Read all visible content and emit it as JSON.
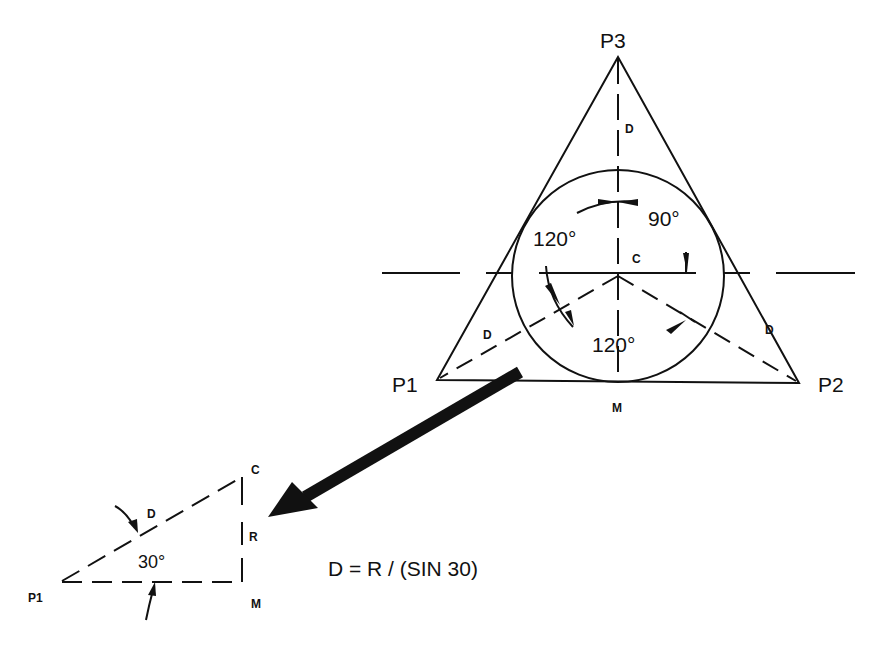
{
  "diagram": {
    "type": "geometric construction",
    "main_figure": {
      "shape": "equilateral triangle with inscribed circle",
      "vertices": {
        "p1": "P1",
        "p2": "P2",
        "p3": "P3"
      },
      "center_label": "C",
      "midpoint_label": "M",
      "distance_labels": [
        "D",
        "D",
        "D"
      ],
      "angles": {
        "left": "120°",
        "bottom": "120°",
        "top_right": "90°"
      }
    },
    "detail_triangle": {
      "vertex_labels": {
        "p1": "P1",
        "c": "C",
        "m": "M"
      },
      "hypotenuse_label": "D",
      "side_label": "R",
      "angle_label": "30°"
    },
    "formula": "D = R / (SIN 30)",
    "colors": {
      "stroke": "#111111",
      "background": "#ffffff"
    }
  }
}
